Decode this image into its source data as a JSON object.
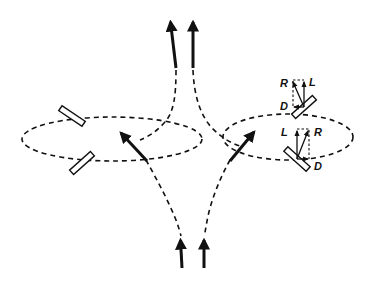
{
  "diagram": {
    "labels": {
      "upper_right": {
        "R": "R",
        "L": "L",
        "D": "D"
      },
      "lower_right": {
        "L": "L",
        "R": "R",
        "D": "D"
      }
    },
    "colors": {
      "stroke": "#111111",
      "background": "#ffffff",
      "wing_fill": "#ffffff"
    },
    "elements": {
      "flow_arrows_top": 2,
      "flow_arrows_bottom": 2,
      "loops": 2,
      "wing_sections_left": 2,
      "wing_sections_right": 2
    }
  }
}
